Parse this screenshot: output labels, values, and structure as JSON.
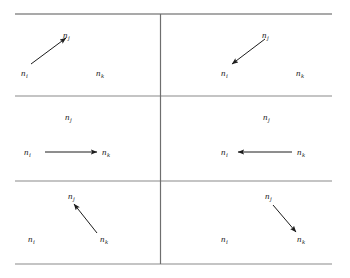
{
  "figure": {
    "title": "",
    "type": "directed-edge-orientation-grid",
    "background_color": "#ffffff",
    "line_color": "#8a8a8a",
    "top_line_color": "#555555",
    "divider_color": "#6e6e6e",
    "arrow_color": "#1c1c1c",
    "text_color": "#1c1c1c",
    "grid": {
      "rows": 3,
      "cols": 2,
      "left": 15,
      "right": 332,
      "divider_x": 160,
      "horizontal_rules_y": [
        14,
        96,
        181,
        264
      ]
    },
    "node_names": {
      "i": "n",
      "j": "n",
      "k": "n"
    },
    "subscripts": {
      "i": "i",
      "j": "j",
      "k": "k"
    },
    "cells": [
      {
        "id": "cell-top-left",
        "row": 1,
        "col": 1,
        "edge": "n_i -> n_j",
        "arrow_direction": "up-right",
        "labels": [
          {
            "name": "label-nj",
            "base": "n",
            "sub": "j",
            "x": 63,
            "y": 31
          },
          {
            "name": "label-ni",
            "base": "n",
            "sub": "i",
            "x": 21,
            "y": 69
          },
          {
            "name": "label-nk",
            "base": "n",
            "sub": "k",
            "x": 96,
            "y": 69
          }
        ],
        "arrow": {
          "x1": 31,
          "y1": 64,
          "x2": 66,
          "y2": 38
        }
      },
      {
        "id": "cell-top-right",
        "row": 1,
        "col": 2,
        "edge": "n_j -> n_i",
        "arrow_direction": "down-left",
        "labels": [
          {
            "name": "label-nj",
            "base": "n",
            "sub": "j",
            "x": 262,
            "y": 31
          },
          {
            "name": "label-ni",
            "base": "n",
            "sub": "i",
            "x": 221,
            "y": 69
          },
          {
            "name": "label-nk",
            "base": "n",
            "sub": "k",
            "x": 296,
            "y": 69
          }
        ],
        "arrow": {
          "x1": 265,
          "y1": 39,
          "x2": 232,
          "y2": 64
        }
      },
      {
        "id": "cell-middle-left",
        "row": 2,
        "col": 1,
        "edge": "n_i -> n_k",
        "arrow_direction": "right",
        "labels": [
          {
            "name": "label-nj",
            "base": "n",
            "sub": "j",
            "x": 65,
            "y": 113
          },
          {
            "name": "label-ni",
            "base": "n",
            "sub": "i",
            "x": 24,
            "y": 148
          },
          {
            "name": "label-nk",
            "base": "n",
            "sub": "k",
            "x": 102,
            "y": 148
          }
        ],
        "arrow": {
          "x1": 45,
          "y1": 152,
          "x2": 97,
          "y2": 152
        }
      },
      {
        "id": "cell-middle-right",
        "row": 2,
        "col": 2,
        "edge": "n_k -> n_i",
        "arrow_direction": "left",
        "labels": [
          {
            "name": "label-nj",
            "base": "n",
            "sub": "j",
            "x": 263,
            "y": 113
          },
          {
            "name": "label-ni",
            "base": "n",
            "sub": "i",
            "x": 221,
            "y": 148
          },
          {
            "name": "label-nk",
            "base": "n",
            "sub": "k",
            "x": 297,
            "y": 148
          }
        ],
        "arrow": {
          "x1": 292,
          "y1": 152,
          "x2": 238,
          "y2": 152
        }
      },
      {
        "id": "cell-bottom-left",
        "row": 3,
        "col": 1,
        "edge": "n_k -> n_j",
        "arrow_direction": "up-left",
        "labels": [
          {
            "name": "label-nj",
            "base": "n",
            "sub": "j",
            "x": 68,
            "y": 192
          },
          {
            "name": "label-ni",
            "base": "n",
            "sub": "i",
            "x": 28,
            "y": 235
          },
          {
            "name": "label-nk",
            "base": "n",
            "sub": "k",
            "x": 100,
            "y": 235
          }
        ],
        "arrow": {
          "x1": 97,
          "y1": 233,
          "x2": 74,
          "y2": 204
        }
      },
      {
        "id": "cell-bottom-right",
        "row": 3,
        "col": 2,
        "edge": "n_j -> n_k",
        "arrow_direction": "down-right",
        "labels": [
          {
            "name": "label-nj",
            "base": "n",
            "sub": "j",
            "x": 265,
            "y": 192
          },
          {
            "name": "label-ni",
            "base": "n",
            "sub": "i",
            "x": 221,
            "y": 235
          },
          {
            "name": "label-nk",
            "base": "n",
            "sub": "k",
            "x": 297,
            "y": 235
          }
        ],
        "arrow": {
          "x1": 273,
          "y1": 205,
          "x2": 296,
          "y2": 232
        }
      }
    ]
  }
}
